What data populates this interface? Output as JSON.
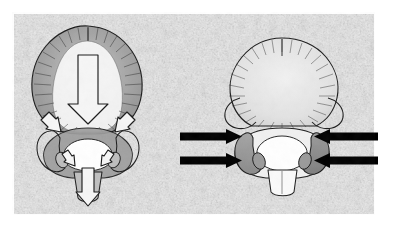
{
  "figure": {
    "title": "Atlas (C1) vertebra load-transmission diagram",
    "type": "anatomical-line-drawing",
    "panel_count": 2,
    "background_label": "mottled-gray-photographic-plate",
    "canvas": {
      "width": 393,
      "height": 231
    }
  },
  "colors": {
    "plate_background": "#f2f2f2",
    "plate_texture_dark": "#b9b9b9",
    "plate_texture_light": "#fafafa",
    "page_background": "#ffffff",
    "ink_outline": "#1d1d1d",
    "solid_arrow": "#000000",
    "hollow_arrow_fill": "#f6f6f6",
    "hollow_arrow_stroke": "#1a1a1a",
    "shade_mid": "#9e9e9e",
    "shade_light": "#c4c4c4",
    "shade_dark": "#858585",
    "bone_fill": "#ffffff"
  },
  "plate": {
    "x": 12,
    "y": 12,
    "width": 363,
    "height": 203
  },
  "panels": [
    {
      "id": "left",
      "name": "left-panel",
      "label": "Left panel — hollow force-flow arrows",
      "view": "superior view of vertebra with posterior arch",
      "shading": "graded gray wash over the body and lateral masses",
      "arrows": [
        {
          "name": "central-down-arrow",
          "style": "hollow",
          "direction": "down",
          "size": "large",
          "x": 75,
          "y": 55,
          "length": 65
        },
        {
          "name": "left-oblique-arrow",
          "style": "hollow",
          "direction": "down-right",
          "size": "small",
          "x": 48,
          "y": 122
        },
        {
          "name": "right-oblique-arrow",
          "style": "hollow",
          "direction": "down-left",
          "size": "small",
          "x": 104,
          "y": 122
        },
        {
          "name": "left-inner-arrow",
          "style": "hollow",
          "direction": "down-right",
          "size": "tiny",
          "x": 66,
          "y": 160
        },
        {
          "name": "right-inner-arrow",
          "style": "hollow",
          "direction": "down-left",
          "size": "tiny",
          "x": 88,
          "y": 160
        },
        {
          "name": "bottom-down-arrow",
          "style": "hollow",
          "direction": "down",
          "size": "medium",
          "x": 78,
          "y": 178,
          "length": 30
        }
      ]
    },
    {
      "id": "right",
      "name": "right-panel",
      "label": "Right panel — solid indicator arrows",
      "view": "superior view of vertebra with shaded lateral masses",
      "shading": "dark gray wash confined to the paired lateral masses",
      "arrows": [
        {
          "name": "solid-arrow-left-upper",
          "style": "solid",
          "direction": "right",
          "x1": 180,
          "x2": 241,
          "y": 136
        },
        {
          "name": "solid-arrow-left-lower",
          "style": "solid",
          "direction": "right",
          "x1": 180,
          "x2": 241,
          "y": 160
        },
        {
          "name": "solid-arrow-right-upper",
          "style": "solid",
          "direction": "left",
          "x1": 378,
          "x2": 314,
          "y": 136
        },
        {
          "name": "solid-arrow-right-lower",
          "style": "solid",
          "direction": "left",
          "x1": 378,
          "x2": 314,
          "y": 160
        }
      ]
    }
  ],
  "annotations": {
    "text_labels": [],
    "caption": ""
  }
}
